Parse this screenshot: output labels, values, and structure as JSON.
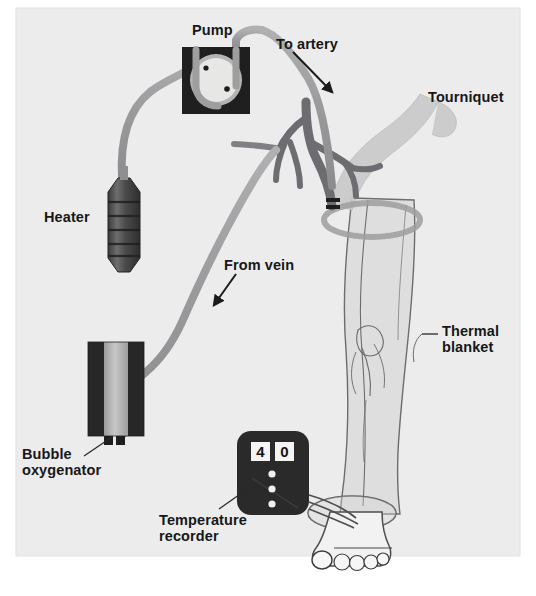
{
  "figure": {
    "background_color": "#ffffff",
    "plate_color": "#ececed",
    "plate": {
      "x": 16,
      "y": 8,
      "width": 504,
      "height": 548
    }
  },
  "colors": {
    "tubing": "#9a9a9c",
    "tubing_dark": "#86868a",
    "device_dark": "#2b2b2b",
    "device_mid": "#5b5b5b",
    "device_light": "#bdbdbd",
    "vessel": "#6e6e72",
    "vessel_dark": "#5a5a5e",
    "limb_fill": "#dcdcdc",
    "limb_outline": "#6b6b6b",
    "tourniquet": "#c9c9c9",
    "recorder_body": "#2a2a2a",
    "display_bg": "#f4f4f2",
    "label_text": "#171717",
    "arrow": "#1b1b1b"
  },
  "labels": [
    {
      "id": "pump",
      "text": "Pump",
      "x": 192,
      "y": 22,
      "align": "left"
    },
    {
      "id": "to-artery",
      "text": "To artery",
      "x": 276,
      "y": 36,
      "align": "left"
    },
    {
      "id": "tourniquet",
      "text": "Tourniquet",
      "x": 428,
      "y": 89,
      "align": "left"
    },
    {
      "id": "heater",
      "text": "Heater",
      "x": 44,
      "y": 209,
      "align": "left"
    },
    {
      "id": "from-vein",
      "text": "From vein",
      "x": 224,
      "y": 257,
      "align": "left"
    },
    {
      "id": "thermal-blanket",
      "text": "Thermal\nblanket",
      "x": 442,
      "y": 323,
      "align": "left"
    },
    {
      "id": "bubble-oxygenator",
      "text": "Bubble\noxygenator",
      "x": 22,
      "y": 446,
      "align": "left"
    },
    {
      "id": "temperature-recorder",
      "text": "Temperature\nrecorder",
      "x": 159,
      "y": 512,
      "align": "left"
    }
  ],
  "components": {
    "pump": {
      "name": "roller-pump",
      "housing": {
        "x": 182,
        "y": 47,
        "width": 68,
        "height": 67
      },
      "rotor_center": {
        "x": 216,
        "y": 80
      },
      "rotor_radius": 24,
      "roller_dots": [
        {
          "x": 206,
          "y": 68
        },
        {
          "x": 227,
          "y": 88
        }
      ]
    },
    "heater": {
      "name": "blood-heater",
      "x": 108,
      "y": 178,
      "width": 30,
      "height": 94,
      "rib_count": 5
    },
    "oxygenator": {
      "name": "bubble-oxygenator",
      "x": 88,
      "y": 340,
      "width": 48,
      "height": 98,
      "port_tabs": 2
    },
    "recorder": {
      "name": "temperature-recorder",
      "x": 237,
      "y": 431,
      "width": 72,
      "height": 84,
      "display_value_left": "4",
      "display_value_right": "0",
      "indicator_dots": 3,
      "lead_wires": 3
    },
    "tourniquet": {
      "name": "tourniquet-band",
      "description": "light gray strap wrapped around upper thigh"
    },
    "thermal_blanket": {
      "name": "thermal-blanket",
      "description": "translucent blanket covering the leg"
    },
    "vessels": {
      "name": "arterial-venous-tree",
      "description": "branching femoral vessel tree at the groin"
    },
    "limb": {
      "name": "patient-leg",
      "description": "leg with knee, ankle cuff and foot with five toes"
    }
  },
  "arrows": [
    {
      "id": "to-artery-arrow",
      "from": {
        "x": 293,
        "y": 52
      },
      "to": {
        "x": 334,
        "y": 94
      }
    },
    {
      "id": "from-vein-arrow",
      "from": {
        "x": 235,
        "y": 275
      },
      "to": {
        "x": 213,
        "y": 307
      }
    }
  ],
  "leader_lines": [
    {
      "id": "bubble-oxygenator-leader",
      "from": {
        "x": 83,
        "y": 459
      },
      "to": {
        "x": 112,
        "y": 437
      }
    },
    {
      "id": "temperature-recorder-leader",
      "from": {
        "x": 218,
        "y": 510
      },
      "to": {
        "x": 244,
        "y": 490
      }
    },
    {
      "id": "thermal-blanket-leader",
      "from": {
        "x": 423,
        "y": 334
      },
      "to": {
        "x": 440,
        "y": 334
      }
    }
  ],
  "flow": {
    "circuit_order": [
      "Bubble oxygenator",
      "Heater",
      "Pump",
      "To artery",
      "Limb",
      "From vein",
      "Bubble oxygenator"
    ]
  }
}
